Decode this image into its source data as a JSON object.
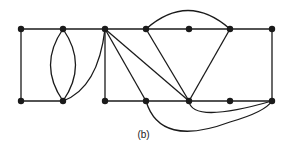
{
  "caption": "(b)",
  "graph": {
    "nodes": [
      {
        "id": "T0",
        "x": 21,
        "y": 29
      },
      {
        "id": "T1",
        "x": 63,
        "y": 29
      },
      {
        "id": "T2",
        "x": 105,
        "y": 29
      },
      {
        "id": "T3",
        "x": 146,
        "y": 29
      },
      {
        "id": "T4",
        "x": 189,
        "y": 29
      },
      {
        "id": "T5",
        "x": 230,
        "y": 29
      },
      {
        "id": "T6",
        "x": 272,
        "y": 29
      },
      {
        "id": "B0",
        "x": 21,
        "y": 101
      },
      {
        "id": "B1",
        "x": 63,
        "y": 101
      },
      {
        "id": "B2",
        "x": 105,
        "y": 101
      },
      {
        "id": "B3",
        "x": 146,
        "y": 101
      },
      {
        "id": "B4",
        "x": 189,
        "y": 101
      },
      {
        "id": "B5",
        "x": 230,
        "y": 101
      },
      {
        "id": "B6",
        "x": 272,
        "y": 101
      }
    ],
    "edges": [
      {
        "d": "M21,29 L272,29"
      },
      {
        "d": "M21,29 L21,101"
      },
      {
        "d": "M21,101 L63,101"
      },
      {
        "d": "M105,101 L272,101"
      },
      {
        "d": "M272,29 L272,101"
      },
      {
        "d": "M63,29 Q38,65 63,101"
      },
      {
        "d": "M63,29 Q88,65 63,101"
      },
      {
        "d": "M105,29 Q98,88 63,101"
      },
      {
        "d": "M105,29 L105,101"
      },
      {
        "d": "M105,29 L146,101"
      },
      {
        "d": "M105,29 L189,101"
      },
      {
        "d": "M146,29 L189,101"
      },
      {
        "d": "M230,29 L189,101"
      },
      {
        "d": "M146,29 Q188,-8 230,29"
      },
      {
        "d": "M189,101 Q192,124 272,101"
      },
      {
        "d": "M146,101 Q160,148 230,122 Q265,112 272,101"
      }
    ],
    "color": "#1a1a1a"
  }
}
